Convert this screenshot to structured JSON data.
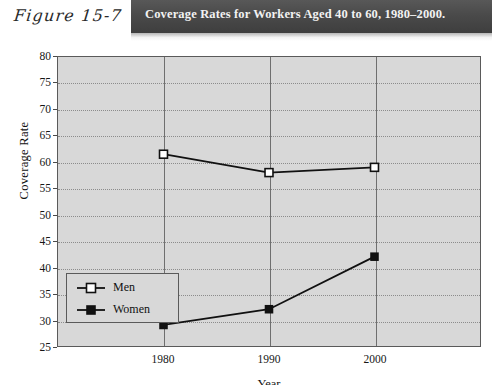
{
  "header": {
    "figure_label": "Figure 15-7",
    "title": "Coverage Rates for Workers Aged 40 to 60, 1980–2000."
  },
  "colors": {
    "title_bar": "#4a4a4a",
    "title_text": "#f2f2f2",
    "plot_background": "#d8d8d8",
    "axis": "#5a5a5a",
    "gridline": "#8c8c8c",
    "series_line": "#111111",
    "men_marker_fill": "#ffffff",
    "women_marker_fill": "#111111"
  },
  "chart_data": {
    "type": "line",
    "title": "Coverage Rates for Workers Aged 40 to 60, 1980–2000.",
    "xlabel": "Year",
    "ylabel": "Coverage Rate",
    "x": [
      1980,
      1990,
      2000
    ],
    "xtick_labels": [
      "1980",
      "1990",
      "2000"
    ],
    "ylim": [
      25,
      80
    ],
    "yticks": [
      25,
      30,
      35,
      40,
      45,
      50,
      55,
      60,
      65,
      70,
      75,
      80
    ],
    "ytick_labels": [
      "25",
      "30",
      "35",
      "40",
      "45",
      "50",
      "55",
      "60",
      "65",
      "70",
      "75",
      "80"
    ],
    "grid": "horizontal-dotted-and-vertical-solid",
    "legend_position": "lower-left-inside",
    "series": [
      {
        "name": "Men",
        "marker": "open-square",
        "values": [
          61.5,
          58,
          59
        ]
      },
      {
        "name": "Women",
        "marker": "filled-square",
        "values": [
          29,
          32,
          42
        ]
      }
    ]
  },
  "legend": {
    "items": [
      {
        "label": "Men"
      },
      {
        "label": "Women"
      }
    ]
  }
}
